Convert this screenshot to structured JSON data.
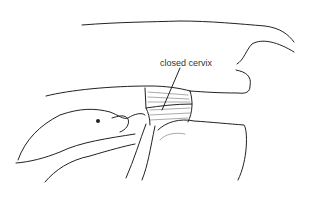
{
  "figure": {
    "type": "anatomical illustration",
    "label": "closed cervix",
    "colors": {
      "line": "#222222",
      "background": "#ffffff",
      "hatch": "#555555"
    }
  }
}
